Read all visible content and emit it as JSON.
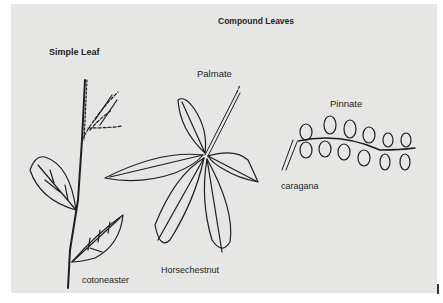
{
  "figure": {
    "title": "Compound Leaves",
    "sections": {
      "simple": {
        "heading": "Simple Leaf",
        "example": "cotoneaster"
      },
      "palmate": {
        "heading": "Palmate",
        "example": "Horsechestnut"
      },
      "pinnate": {
        "heading": "Pinnate",
        "example": "caragana"
      }
    }
  },
  "colors": {
    "background": "#e6e6e4",
    "ink": "#1e1e1e"
  }
}
